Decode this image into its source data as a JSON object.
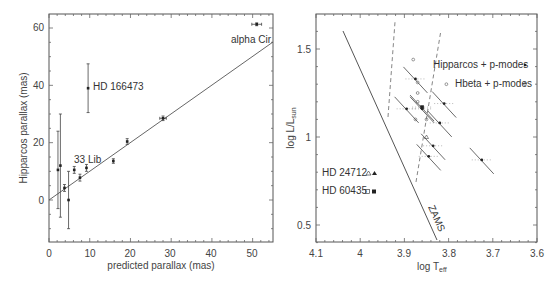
{
  "chart_data": [
    {
      "type": "scatter",
      "title": "",
      "xlabel": "predicted parallax (mas)",
      "ylabel": "Hipparcos parallax (mas)",
      "xlim": [
        0,
        55
      ],
      "ylim": [
        -15,
        65
      ],
      "xticks": [
        0,
        10,
        20,
        30,
        40,
        50
      ],
      "yticks": [
        0,
        20,
        40,
        60
      ],
      "grid": false,
      "points": [
        {
          "x": 2.2,
          "y": 10.5,
          "yerr": 13.5
        },
        {
          "x": 2.8,
          "y": 12.0,
          "yerr": 18.0
        },
        {
          "x": 3.8,
          "y": 4.2,
          "yerr": 1.2
        },
        {
          "x": 4.8,
          "y": 0.0,
          "yerr": 10.0
        },
        {
          "x": 6.2,
          "y": 10.5,
          "yerr": 1.2
        },
        {
          "x": 7.6,
          "y": 7.8,
          "yerr": 1.2
        },
        {
          "x": 9.2,
          "y": 11.2,
          "yerr": 1.2
        },
        {
          "x": 9.6,
          "y": 39.0,
          "yerr": 8.5,
          "label": "HD 166473"
        },
        {
          "x": 15.8,
          "y": 13.6,
          "yerr": 0.8
        },
        {
          "x": 19.2,
          "y": 20.4,
          "yerr": 1.0
        },
        {
          "x": 28.0,
          "y": 28.5,
          "yerr": 0.8,
          "xerr": 0.8
        },
        {
          "x": 51.0,
          "y": 61.3,
          "yerr": 0.5,
          "xerr": 1.2,
          "label": "alpha Cir"
        }
      ],
      "fit_line": {
        "x": [
          0,
          55
        ],
        "y": [
          0.5,
          55
        ]
      },
      "annotations": [
        {
          "text": "alpha Cir",
          "x": 46,
          "y": 56
        },
        {
          "text": "HD 166473",
          "x": 11,
          "y": 39
        },
        {
          "text": "33 Lib",
          "x": 6,
          "y": 14
        }
      ]
    },
    {
      "type": "scatter",
      "title": "",
      "xlabel": "log T_eff",
      "ylabel": "log L/L_sun",
      "xlim": [
        4.1,
        3.6
      ],
      "ylim": [
        0.4,
        1.7
      ],
      "xticks": [
        4.1,
        4.0,
        3.9,
        3.8,
        3.7,
        3.6
      ],
      "yticks": [
        0.5,
        1.0,
        1.5
      ],
      "grid": false,
      "legend": [
        {
          "label": "Hipparcos + p-modes",
          "marker": "filled-circle"
        },
        {
          "label": "Hbeta + p-modes",
          "marker": "open-circle"
        },
        {
          "label": "HD 24712",
          "markers": [
            "open-triangle",
            "filled-triangle"
          ]
        },
        {
          "label": "HD 60435",
          "markers": [
            "open-square",
            "filled-square"
          ]
        }
      ],
      "zams_line": {
        "x": [
          3.97,
          3.83
        ],
        "y": [
          1.6,
          0.45
        ],
        "label": "ZAMS"
      },
      "instability_strip_dashed": [
        {
          "x": [
            3.87,
            3.89
          ],
          "y": [
            1.05,
            1.65
          ]
        },
        {
          "x": [
            3.82,
            3.79
          ],
          "y": [
            0.75,
            1.6
          ]
        }
      ],
      "filled_points": [
        {
          "x": 3.875,
          "y": 1.33
        },
        {
          "x": 3.86,
          "y": 1.16
        },
        {
          "x": 3.895,
          "y": 1.16
        },
        {
          "x": 3.86,
          "y": 1.17,
          "marker": "square"
        },
        {
          "x": 3.81,
          "y": 1.19
        },
        {
          "x": 3.82,
          "y": 1.08
        },
        {
          "x": 3.835,
          "y": 0.95
        },
        {
          "x": 3.845,
          "y": 0.89
        },
        {
          "x": 3.725,
          "y": 0.87
        }
      ],
      "open_points": [
        {
          "x": 3.88,
          "y": 1.44
        },
        {
          "x": 3.87,
          "y": 1.31
        },
        {
          "x": 3.87,
          "y": 1.25
        },
        {
          "x": 3.87,
          "y": 1.2
        },
        {
          "x": 3.875,
          "y": 1.1
        },
        {
          "x": 3.85,
          "y": 1.1
        },
        {
          "x": 3.85,
          "y": 1.0,
          "marker": "triangle"
        },
        {
          "x": 3.805,
          "y": 1.3
        }
      ]
    }
  ],
  "left_chart": {
    "xlabel": "predicted parallax (mas)",
    "ylabel": "Hipparcos parallax (mas)",
    "xtick_labels": [
      "0",
      "10",
      "20",
      "30",
      "40",
      "50"
    ],
    "ytick_labels": [
      "0",
      "20",
      "40",
      "60"
    ],
    "annotations": {
      "alpha_cir": "alpha Cir",
      "hd166473": "HD 166473",
      "lib33": "33 Lib"
    }
  },
  "right_chart": {
    "xlabel_main": "log T",
    "xlabel_sub": "eff",
    "ylabel_main": "log L/L",
    "ylabel_sub": "sun",
    "xtick_labels": [
      "4.1",
      "4",
      "3.9",
      "3.8",
      "3.7",
      "3.6"
    ],
    "ytick_labels": [
      "0.5",
      "1",
      "1.5"
    ],
    "legend": {
      "hipparcos": "Hipparcos + p-modes",
      "hbeta": "Hbeta + p-modes",
      "hd24712": "HD 24712",
      "hd60435": "HD 60435"
    },
    "zams": "ZAMS"
  }
}
